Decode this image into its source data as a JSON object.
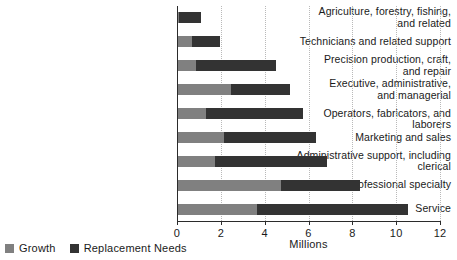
{
  "chart_data": {
    "type": "bar",
    "orientation": "horizontal",
    "stacked": true,
    "title": "",
    "xlabel": "Millions",
    "ylabel": "",
    "xlim": [
      0,
      12
    ],
    "xticks": [
      0,
      2,
      4,
      6,
      8,
      10,
      12
    ],
    "xtick_labels": [
      "0",
      "2",
      "4",
      "6",
      "8",
      "10",
      "12"
    ],
    "grid": "vertical-dotted",
    "legend_position": "bottom-left",
    "categories": [
      "Agriculture, forestry, fishing,\nand related",
      "Technicians and related support",
      "Precision production, craft,\nand repair",
      "Executive, administrative,\nand managerial",
      "Operators, fabricators, and laborers",
      "Marketing and sales",
      "Administrative support, including\nclerical",
      "Professional specialty",
      "Service"
    ],
    "series": [
      {
        "name": "Growth",
        "color": "#808080",
        "values": [
          0.05,
          0.65,
          0.8,
          2.4,
          1.3,
          2.1,
          1.7,
          4.7,
          3.6
        ]
      },
      {
        "name": "Replacement Needs",
        "color": "#333333",
        "values": [
          1.0,
          1.25,
          3.65,
          2.7,
          4.4,
          4.2,
          5.1,
          3.6,
          6.9
        ]
      }
    ],
    "totals": [
      1.05,
      1.9,
      4.45,
      5.1,
      5.7,
      6.3,
      6.8,
      8.3,
      10.5
    ]
  },
  "legend": {
    "items": [
      {
        "label": "Growth",
        "color": "#808080"
      },
      {
        "label": "Replacement Needs",
        "color": "#333333"
      }
    ]
  },
  "axis": {
    "x_title": "Millions"
  },
  "colors": {
    "growth": "#808080",
    "replacement": "#333333",
    "axis": "#2b2b2b",
    "grid": "#b9b9b9",
    "text": "#1a1a1a",
    "background": "#ffffff"
  }
}
